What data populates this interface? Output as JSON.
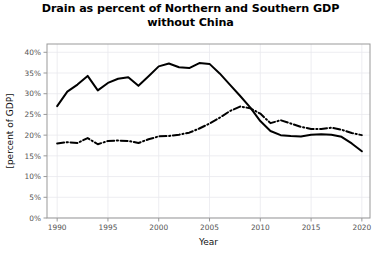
{
  "chart_data": {
    "type": "line",
    "title": "Drain as percent of Northern and Southern GDP without China",
    "title_line1": "Drain as percent of Northern and Southern GDP",
    "title_line2": "without China",
    "xlabel": "Year",
    "ylabel": "[percent of GDP]",
    "xlim": [
      1989,
      2020.8
    ],
    "ylim": [
      0,
      42
    ],
    "grid": true,
    "legend": "none",
    "background_color": "#ffffff",
    "grid_color": "#e8e8ee",
    "axis_color": "#999999",
    "line_color": "#000000",
    "xticks": [
      1990,
      1995,
      2000,
      2005,
      2010,
      2015,
      2020
    ],
    "xtick_labels": [
      "1990",
      "1995",
      "2000",
      "2005",
      "2010",
      "2015",
      "2020"
    ],
    "yticks": [
      0,
      5,
      10,
      15,
      20,
      25,
      30,
      35,
      40
    ],
    "ytick_labels": [
      "0%",
      "5%",
      "10%",
      "15%",
      "20%",
      "25%",
      "30%",
      "35%",
      "40%"
    ],
    "x": [
      1990,
      1991,
      1992,
      1993,
      1994,
      1995,
      1996,
      1997,
      1998,
      1999,
      2000,
      2001,
      2002,
      2003,
      2004,
      2005,
      2006,
      2007,
      2008,
      2009,
      2010,
      2011,
      2012,
      2013,
      2014,
      2015,
      2016,
      2017,
      2018,
      2019,
      2020
    ],
    "series": [
      {
        "name": "Northern GDP",
        "style": "solid",
        "color": "#000000",
        "values": [
          27.0,
          30.5,
          32.2,
          34.3,
          30.8,
          32.6,
          33.6,
          34.0,
          31.9,
          34.2,
          36.6,
          37.3,
          36.4,
          36.2,
          37.4,
          37.2,
          34.9,
          32.2,
          29.5,
          26.7,
          23.4,
          21.0,
          20.0,
          19.8,
          19.7,
          20.1,
          20.2,
          20.1,
          19.6,
          18.0,
          16.1
        ]
      },
      {
        "name": "Southern GDP",
        "style": "dashdot",
        "color": "#000000",
        "values": [
          18.0,
          18.3,
          18.1,
          19.3,
          17.8,
          18.6,
          18.7,
          18.6,
          18.1,
          19.0,
          19.7,
          19.8,
          20.1,
          20.6,
          21.6,
          22.8,
          24.2,
          25.8,
          26.9,
          26.5,
          25.2,
          22.9,
          23.6,
          22.8,
          22.0,
          21.5,
          21.5,
          21.8,
          21.3,
          20.5,
          20.0
        ]
      }
    ]
  }
}
